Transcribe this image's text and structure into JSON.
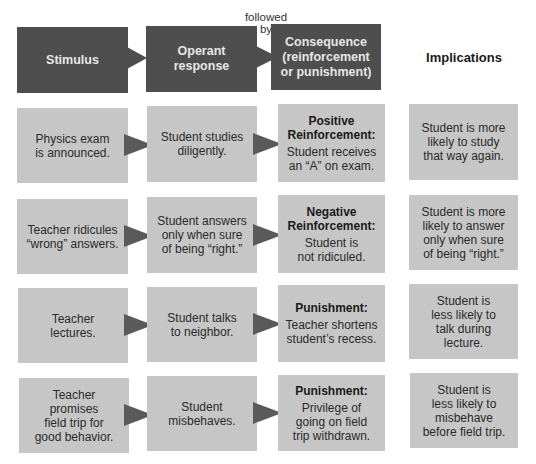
{
  "connector_label": [
    "followed",
    "by"
  ],
  "headers": {
    "stimulus": [
      "Stimulus"
    ],
    "response": [
      "Operant",
      "response"
    ],
    "consequence": [
      "Consequence",
      "(reinforcement",
      "or punishment)"
    ],
    "implications": "Implications"
  },
  "colors": {
    "header_box": "#4e4e4e",
    "row_box": "#c6c6c6",
    "arrow": "#5a5a5a"
  },
  "rows": [
    {
      "stimulus": [
        "Physics exam",
        "is announced."
      ],
      "response": [
        "Student studies",
        "diligently."
      ],
      "consequence_label": [
        "Positive",
        "Reinforcement:"
      ],
      "consequence": [
        "Student receives",
        "an “A” on exam."
      ],
      "implication": [
        "Student is more",
        "likely to study",
        "that way again."
      ]
    },
    {
      "stimulus": [
        "Teacher ridicules",
        "“wrong” answers."
      ],
      "response": [
        "Student answers",
        "only when sure",
        "of being “right.”"
      ],
      "consequence_label": [
        "Negative",
        "Reinforcement:"
      ],
      "consequence": [
        "Student is",
        "not ridiculed."
      ],
      "implication": [
        "Student is more",
        "likely to answer",
        "only when sure",
        "of being “right.”"
      ]
    },
    {
      "stimulus": [
        "Teacher",
        "lectures."
      ],
      "response": [
        "Student talks",
        "to neighbor."
      ],
      "consequence_label": [
        "Punishment:"
      ],
      "consequence": [
        "Teacher shortens",
        "student’s recess."
      ],
      "implication": [
        "Student is",
        "less likely to",
        "talk during",
        "lecture."
      ]
    },
    {
      "stimulus": [
        "Teacher",
        "promises",
        "field trip for",
        "good behavior."
      ],
      "response": [
        "Student",
        "misbehaves."
      ],
      "consequence_label": [
        "Punishment:"
      ],
      "consequence": [
        "Privilege of",
        "going on field",
        "trip withdrawn."
      ],
      "implication": [
        "Student is",
        "less likely to",
        "misbehave",
        "before field trip."
      ]
    }
  ]
}
